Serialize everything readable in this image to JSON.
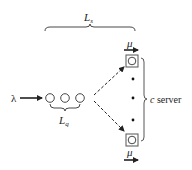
{
  "diagram": {
    "type": "queueing-system",
    "labels": {
      "system_length": "L",
      "system_length_sub": "s",
      "queue_length": "L",
      "queue_length_sub": "q",
      "arrival_rate": "λ",
      "service_rate_top": "μ",
      "service_rate_bottom": "μ",
      "servers_var": "c",
      "servers_text": " server"
    },
    "queue": {
      "waiting_customers": 3
    },
    "servers": {
      "shown": 2,
      "ellipsis_dots": 3
    },
    "colors": {
      "stroke": "#222222",
      "box": "#555555",
      "background": "#ffffff"
    }
  }
}
